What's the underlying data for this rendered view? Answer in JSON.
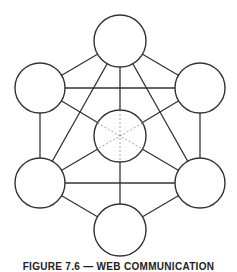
{
  "figure": {
    "caption": "FIGURE 7.6 — WEB COMMUNICATION",
    "stroke_color": "#333333",
    "dotted_color": "#888888",
    "nodes": [
      {
        "id": "top",
        "cx": 120,
        "cy": 41,
        "r": 26
      },
      {
        "id": "upper-left",
        "cx": 40,
        "cy": 88,
        "r": 25
      },
      {
        "id": "upper-right",
        "cx": 200,
        "cy": 88,
        "r": 25
      },
      {
        "id": "center",
        "cx": 120,
        "cy": 136,
        "r": 26
      },
      {
        "id": "lower-left",
        "cx": 40,
        "cy": 183,
        "r": 25
      },
      {
        "id": "lower-right",
        "cx": 200,
        "cy": 183,
        "r": 25
      },
      {
        "id": "bottom",
        "cx": 120,
        "cy": 230,
        "r": 26
      }
    ]
  }
}
